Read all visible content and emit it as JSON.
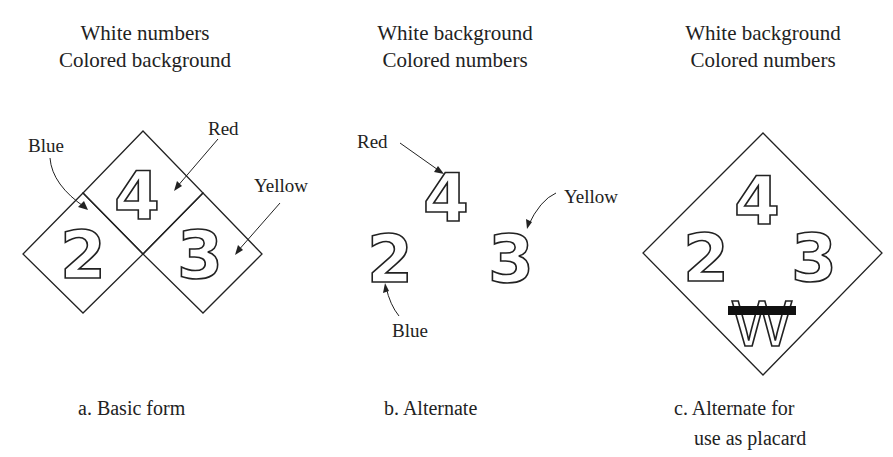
{
  "panels": [
    {
      "id": "a",
      "header": [
        "White numbers",
        "Colored background"
      ],
      "caption": [
        "a. Basic form"
      ],
      "numbers": {
        "top": "4",
        "left": "2",
        "right": "3"
      },
      "labels": {
        "top": "Red",
        "left": "Blue",
        "right": "Yellow"
      }
    },
    {
      "id": "b",
      "header": [
        "White background",
        "Colored numbers"
      ],
      "caption": [
        "b. Alternate"
      ],
      "numbers": {
        "top": "4",
        "left": "2",
        "right": "3"
      },
      "labels": {
        "top": "Red",
        "left": "Blue",
        "right": "Yellow"
      }
    },
    {
      "id": "c",
      "header": [
        "White background",
        "Colored numbers"
      ],
      "caption": [
        "c. Alternate for",
        "use as placard"
      ],
      "numbers": {
        "top": "4",
        "left": "2",
        "right": "3",
        "bottom": "W"
      }
    }
  ]
}
